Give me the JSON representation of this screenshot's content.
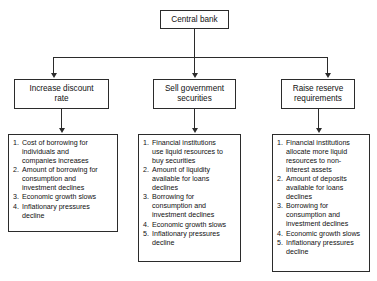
{
  "diagram": {
    "type": "flowchart",
    "orientation": "top-down",
    "colors": {
      "box_border": "#2b2b2b",
      "box_fill": "#ffffff",
      "connector": "#2b2b2b",
      "text": "#111111",
      "background": "#ffffff"
    },
    "root": {
      "label": "Central bank"
    },
    "branches": [
      {
        "action_label": "Increase discount\nrate",
        "consequences": [
          {
            "number": "1.",
            "text": "Cost of borrowing for\nindividuals and\ncompanies increases"
          },
          {
            "number": "2.",
            "text": "Amount of borrowing for\nconsumption and\ninvestment declines"
          },
          {
            "number": "3.",
            "text": "Economic growth slows"
          },
          {
            "number": "4.",
            "text": "Inflationary pressures\ndecline"
          }
        ]
      },
      {
        "action_label": "Sell government\nsecurities",
        "consequences": [
          {
            "number": "1.",
            "text": "Financial institutions\nuse liquid resources to\nbuy securities"
          },
          {
            "number": "2.",
            "text": "Amount of liquidity\navailable for loans\ndeclines"
          },
          {
            "number": "3.",
            "text": "Borrowing for\nconsumption and\ninvestment declines"
          },
          {
            "number": "4.",
            "text": "Economic growth slows"
          },
          {
            "number": "5.",
            "text": "Inflationary pressures\ndecline"
          }
        ]
      },
      {
        "action_label": "Raise reserve\nrequirements",
        "consequences": [
          {
            "number": "1.",
            "text": "Financial institutions\nallocate more liquid\nresources to non-\ninterest assets"
          },
          {
            "number": "2.",
            "text": "Amount of deposits\navailable for loans\ndeclines"
          },
          {
            "number": "3.",
            "text": "Borrowing for\nconsumption and\ninvestment declines"
          },
          {
            "number": "4.",
            "text": "Economic growth slows"
          },
          {
            "number": "5.",
            "text": "Inflationary pressures\ndecline"
          }
        ]
      }
    ]
  }
}
